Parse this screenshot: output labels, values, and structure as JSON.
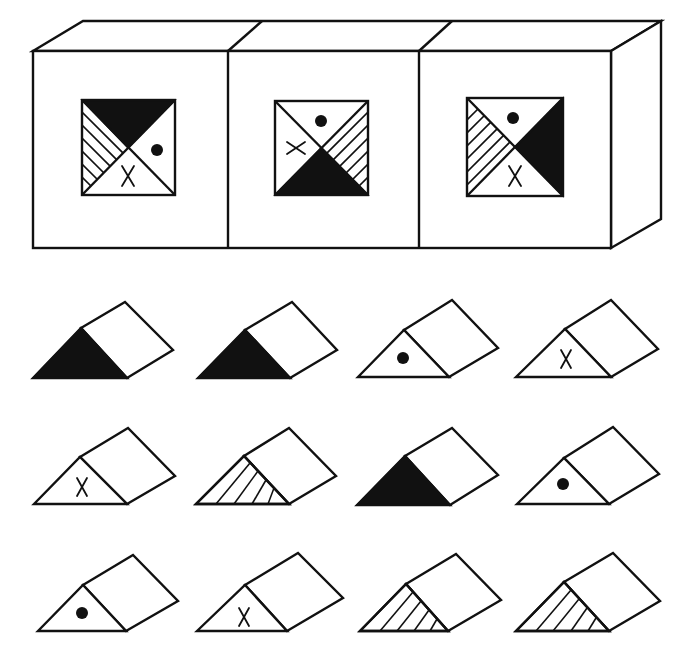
{
  "title": "Spatial reasoning puzzle: which triangular prism can be cut from the block",
  "colors": {
    "ink": "#111111",
    "paper": "#ffffff"
  },
  "block": {
    "description": "Three-section rectangular block shown in oblique perspective; each front panel carries a square divided into four triangles by its diagonals",
    "faces": [
      {
        "id": "panel-1",
        "top": "black",
        "left": "hatched",
        "right": "dot",
        "bottom": "X"
      },
      {
        "id": "panel-2",
        "top": "dot",
        "left": "X",
        "right": "hatched",
        "bottom": "black"
      },
      {
        "id": "panel-3",
        "top": "dot",
        "left": "hatched",
        "right": "black",
        "bottom": "X"
      }
    ]
  },
  "options": {
    "description": "Twelve triangular prism candidates arranged in a 3×4 grid",
    "items": [
      {
        "index": 1,
        "front": "black"
      },
      {
        "index": 2,
        "front": "black"
      },
      {
        "index": 3,
        "front": "dot"
      },
      {
        "index": 4,
        "front": "X"
      },
      {
        "index": 5,
        "front": "X"
      },
      {
        "index": 6,
        "front": "hatched"
      },
      {
        "index": 7,
        "front": "black"
      },
      {
        "index": 8,
        "front": "dot"
      },
      {
        "index": 9,
        "front": "dot"
      },
      {
        "index": 10,
        "front": "X"
      },
      {
        "index": 11,
        "front": "hatched"
      },
      {
        "index": 12,
        "front": "hatched"
      }
    ]
  }
}
